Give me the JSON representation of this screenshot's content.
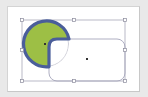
{
  "diagram": {
    "colors": {
      "background": "#e9e9e9",
      "canvas": "#ffffff",
      "circle_fill": "#9dbf45",
      "shape_stroke": "#4a5e9a",
      "selection_line": "#a9a9b8",
      "guide_line": "#b8b8c4",
      "center_dot": "#333333"
    },
    "shapes": [
      {
        "type": "circle",
        "label": "circle",
        "cx": 46,
        "cy": 44,
        "r": 23
      },
      {
        "type": "rounded-rect",
        "label": "rounded-rectangle",
        "x": 49,
        "y": 39,
        "width": 76,
        "height": 42,
        "rx": 8
      }
    ],
    "selection": {
      "x": 22,
      "y": 20,
      "width": 103,
      "height": 61
    },
    "handles": [
      {
        "x": 22,
        "y": 20
      },
      {
        "x": 74,
        "y": 20
      },
      {
        "x": 125,
        "y": 20
      },
      {
        "x": 22,
        "y": 50
      },
      {
        "x": 125,
        "y": 50
      },
      {
        "x": 22,
        "y": 81
      },
      {
        "x": 74,
        "y": 81
      },
      {
        "x": 125,
        "y": 81
      }
    ],
    "center_points": [
      {
        "x": 45,
        "y": 44
      },
      {
        "x": 87,
        "y": 59
      }
    ]
  }
}
